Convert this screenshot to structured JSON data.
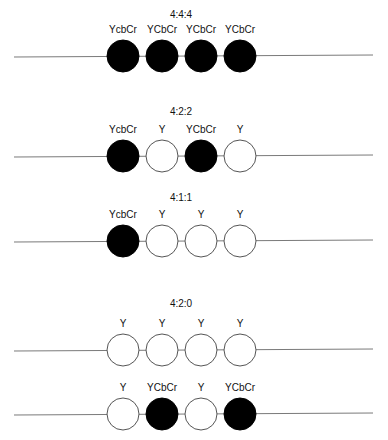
{
  "diagram": {
    "colors": {
      "filled": "#000000",
      "empty": "#ffffff",
      "line": "#7a7a7a",
      "text": "#111111"
    },
    "rows": [
      {
        "id": "r444",
        "title": "4:4:4",
        "title_y": 18,
        "label_y": 33,
        "line_y": 56,
        "samples": [
          {
            "label": "YcbCr",
            "filled": true
          },
          {
            "label": "YCbCr",
            "filled": true
          },
          {
            "label": "YCbCr",
            "filled": true
          },
          {
            "label": "YCbCr",
            "filled": true
          }
        ]
      },
      {
        "id": "r422",
        "title": "4:2:2",
        "title_y": 115,
        "label_y": 133,
        "line_y": 156,
        "samples": [
          {
            "label": "YcbCr",
            "filled": true
          },
          {
            "label": "Y",
            "filled": false
          },
          {
            "label": "YCbCr",
            "filled": true
          },
          {
            "label": "Y",
            "filled": false
          }
        ]
      },
      {
        "id": "r411",
        "title": "4:1:1",
        "title_y": 201,
        "label_y": 218,
        "line_y": 241,
        "samples": [
          {
            "label": "YcbCr",
            "filled": true
          },
          {
            "label": "Y",
            "filled": false
          },
          {
            "label": "Y",
            "filled": false
          },
          {
            "label": "Y",
            "filled": false
          }
        ]
      },
      {
        "id": "r420a",
        "title": "4:2:0",
        "title_y": 307,
        "label_y": 327,
        "line_y": 350,
        "samples": [
          {
            "label": "Y",
            "filled": false
          },
          {
            "label": "Y",
            "filled": false
          },
          {
            "label": "Y",
            "filled": false
          },
          {
            "label": "Y",
            "filled": false
          }
        ]
      },
      {
        "id": "r420b",
        "title": "",
        "title_y": 0,
        "label_y": 391,
        "line_y": 414,
        "samples": [
          {
            "label": "Y",
            "filled": false
          },
          {
            "label": "YCbCr",
            "filled": true
          },
          {
            "label": "Y",
            "filled": false
          },
          {
            "label": "YCbCr",
            "filled": true
          }
        ]
      }
    ]
  }
}
